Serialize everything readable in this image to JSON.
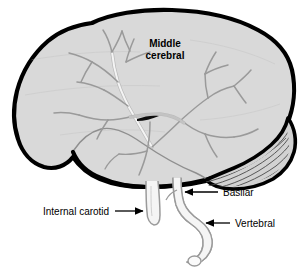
{
  "figure": {
    "background_color": "#ffffff",
    "brain_fill_color": "#d9d9d9",
    "brain_outline_color": "#000000",
    "artery_fill_color": "#f2f2f2",
    "artery_stroke_color": "#9a9a9a",
    "cerebellum_fill_color": "#d2d2d2",
    "cerebellum_hatch_color": "#4a4a4a",
    "label_color": "#000000"
  },
  "labels": {
    "middle_cerebral": {
      "line1": "Middle",
      "line2": "cerebral",
      "style": "bold",
      "font_size_px": 10,
      "x": 165,
      "y": 47
    },
    "basilar": {
      "text": "Basilar",
      "style": "regular",
      "font_size_px": 10,
      "x": 223,
      "y": 196,
      "arrow_direction": "left"
    },
    "internal_carotid": {
      "text": "Internal carotid",
      "style": "regular",
      "font_size_px": 10,
      "x": 43,
      "y": 215,
      "arrow_direction": "right"
    },
    "vertebral": {
      "text": "Vertebral",
      "style": "regular",
      "font_size_px": 10,
      "x": 235,
      "y": 227,
      "arrow_direction": "left"
    }
  },
  "leader_lines": {
    "basilar": {
      "x1": 218,
      "y1": 192,
      "x2": 181,
      "y2": 192
    },
    "internal_carotid": {
      "x1": 115,
      "y1": 211,
      "x2": 145,
      "y2": 211
    },
    "vertebral": {
      "x1": 230,
      "y1": 223,
      "x2": 203,
      "y2": 223
    }
  },
  "structures": {
    "cerebrum": "cerebral hemisphere lateral surface",
    "cerebellum": "cerebellum with folia hatching",
    "temporal_lobe": "temporal lobe",
    "lateral_sulcus": "lateral sulcus dark marking",
    "middle_cerebral_artery": "branching middle cerebral artery tree",
    "internal_carotid_artery": "internal carotid artery stem",
    "basilar_artery": "basilar artery",
    "vertebral_artery": "vertebral artery with cut end"
  }
}
